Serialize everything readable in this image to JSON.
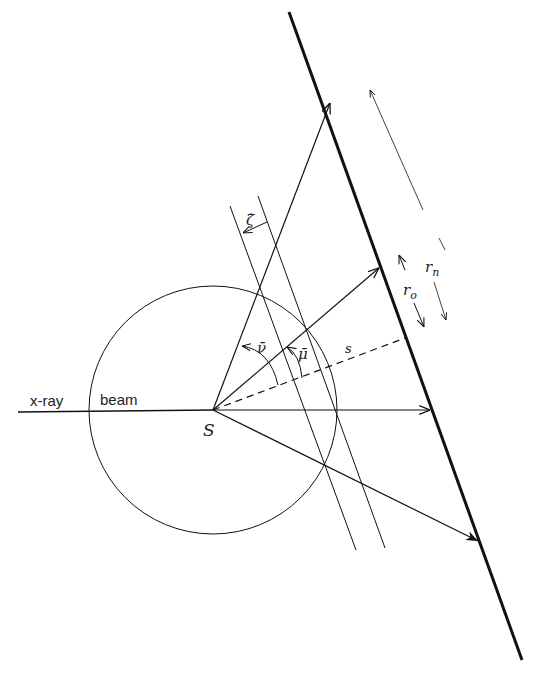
{
  "labels": {
    "xray": "x-ray",
    "beam": "beam",
    "source": "S",
    "s": "s",
    "nu": "ν̄",
    "mu": "μ̄",
    "zeta": "ζ̇",
    "r_o": "r",
    "r_o_sub": "o",
    "r_n": "r",
    "r_n_sub": "n"
  },
  "colors": {
    "line": "#111111",
    "background": "#ffffff"
  }
}
